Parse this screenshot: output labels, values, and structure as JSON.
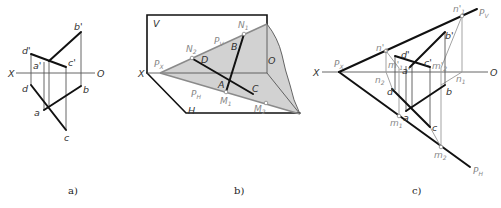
{
  "figures": [
    {
      "id": "a",
      "caption": "a)",
      "axis": {
        "left": "X",
        "right": "O"
      },
      "labels": {
        "b_prime": "b'",
        "d_prime": "d'",
        "a_prime": "a'",
        "c_prime": "c'",
        "d": "d",
        "b": "b",
        "a": "a",
        "c": "c"
      }
    },
    {
      "id": "b",
      "caption": "b)",
      "labels": {
        "V": "V",
        "H": "H",
        "X": "X",
        "O": "O",
        "Px": "P",
        "Px_sub": "X",
        "Pv": "P",
        "Pv_sub": "V",
        "Ph": "P",
        "Ph_sub": "H",
        "N1": "N",
        "N1_sub": "1",
        "N2": "N",
        "N2_sub": "2",
        "M1": "M",
        "M1_sub": "1",
        "M2": "M",
        "M2_sub": "2",
        "A": "A",
        "B": "B",
        "C": "C",
        "D": "D"
      },
      "colors": {
        "plane_fill": "#cfcfcf"
      }
    },
    {
      "id": "c",
      "caption": "c)",
      "axis": {
        "left": "X",
        "right": "O"
      },
      "labels": {
        "Px": "P",
        "Px_sub": "X",
        "Pv": "P",
        "Pv_sub": "V",
        "Ph": "P",
        "Ph_sub": "H",
        "n1p": "n'",
        "n1p_sub": "1",
        "n2p": "n'",
        "n2p_sub": "2",
        "m1p": "m'",
        "m1p_sub": "1",
        "m2p": "m'",
        "m2p_sub": "2",
        "n1": "n",
        "n1_sub": "1",
        "n2": "n",
        "n2_sub": "2",
        "m1": "m",
        "m1_sub": "1",
        "m2": "m",
        "m2_sub": "2",
        "a_prime": "a'",
        "b_prime": "b'",
        "c_prime": "c'",
        "d_prime": "d'",
        "a": "a",
        "b": "b",
        "c": "c",
        "d": "d"
      }
    }
  ]
}
